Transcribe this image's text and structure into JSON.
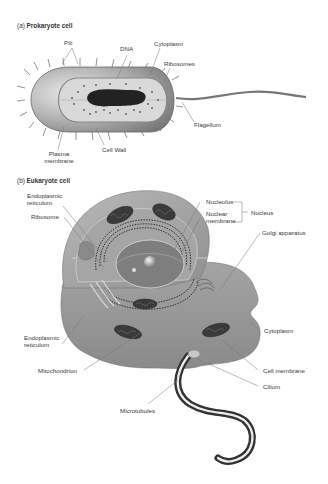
{
  "figure_a": {
    "prefix": "(a)",
    "title": "Prokaryote cell",
    "labels": {
      "pili": "Pili",
      "dna": "DNA",
      "cytoplasm": "Cytoplasm",
      "ribosomes": "Ribosomes",
      "flagellum": "Flagellum",
      "cell_wall": "Cell Wall",
      "plasma_membrane_1": "Plasma",
      "plasma_membrane_2": "membrane"
    }
  },
  "figure_b": {
    "prefix": "(b)",
    "title": "Eukaryote cell",
    "labels": {
      "er_top_1": "Endoplasmic",
      "er_top_2": "reticulum",
      "ribosome": "Ribosome",
      "nucleolus": "Nucleolus",
      "nuclear_membrane_1": "Nuclear",
      "nuclear_membrane_2": "membrane",
      "nucleus": "Nucleus",
      "golgi": "Golgi apparatus",
      "er_bottom_1": "Endoplasmic",
      "er_bottom_2": "reticulum",
      "cytoplasm": "Cytoplasm",
      "mitochondrion": "Mitochondrion",
      "cell_membrane": "Cell membrane",
      "cilium": "Cilium",
      "microtubules": "Microtubules"
    }
  },
  "colors": {
    "cell_body": "#9a9a9a",
    "cell_light": "#c8c8c8",
    "inner": "#d9d9d9",
    "dark": "#2b2b2b",
    "leader_line": "#777777",
    "text": "#3a3a3a"
  }
}
